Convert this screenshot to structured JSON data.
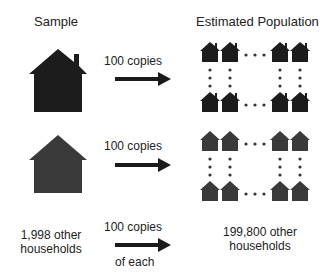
{
  "headers": {
    "left": "Sample",
    "right": "Estimated Population"
  },
  "rows": [
    {
      "arrow_label": "100 copies",
      "arrow_sublabel": "",
      "house_style": "chimney",
      "color": "#1c1c1c"
    },
    {
      "arrow_label": "100 copies",
      "arrow_sublabel": "",
      "house_style": "plain",
      "color": "#3a3a3a"
    },
    {
      "left_text_line1": "1,998 other",
      "left_text_line2": "households",
      "arrow_label": "100 copies",
      "arrow_sublabel": "of each",
      "right_text_line1": "199,800 other",
      "right_text_line2": "households"
    }
  ],
  "colors": {
    "dark_house": "#1c1c1c",
    "gray_house": "#3a3a3a",
    "arrow": "#1a1a1a",
    "text": "#222222"
  }
}
